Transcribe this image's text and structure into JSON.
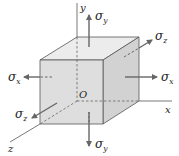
{
  "diagram": {
    "title": "",
    "type": "3D stress element",
    "colors": {
      "front_face": "#dcdcdc",
      "top_face": "#ececec",
      "right_face": "#cfcfcf",
      "edge": "#555555",
      "axis": "#444444",
      "arrow": "#666666"
    },
    "origin_label": "O",
    "axes": [
      {
        "id": "x",
        "label": "x"
      },
      {
        "id": "y",
        "label": "y"
      },
      {
        "id": "z",
        "label": "z"
      }
    ],
    "stresses": [
      {
        "id": "sigma-y-top",
        "symbol": "σ",
        "subscript": "y",
        "direction": "up"
      },
      {
        "id": "sigma-y-bottom",
        "symbol": "σ",
        "subscript": "y",
        "direction": "down"
      },
      {
        "id": "sigma-x-left",
        "symbol": "σ",
        "subscript": "x",
        "direction": "left"
      },
      {
        "id": "sigma-x-right",
        "symbol": "σ",
        "subscript": "x",
        "direction": "right"
      },
      {
        "id": "sigma-z-front",
        "symbol": "σ",
        "subscript": "z",
        "direction": "front-left-down"
      },
      {
        "id": "sigma-z-back",
        "symbol": "σ",
        "subscript": "z",
        "direction": "back-right-up"
      }
    ]
  }
}
